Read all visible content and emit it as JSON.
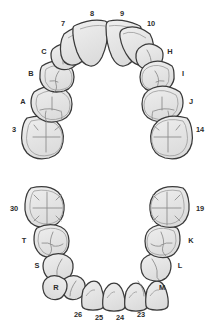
{
  "diagram": {
    "colors": {
      "background": "#ffffff",
      "tooth_fill": "#e6e6e6",
      "tooth_fill_light": "#ececec",
      "outline": "#3a3a3a",
      "inner_line": "#9a9a9a",
      "label_text": "#2b2b2b"
    },
    "arches": [
      {
        "name": "upper-arch",
        "label": "Maxillary arch",
        "teeth": [
          {
            "id": "upper-left-first-permanent-molar",
            "label": "3",
            "label_x": 14,
            "label_y": 130,
            "anchor": "mid",
            "type": "molar"
          },
          {
            "id": "upper-left-second-primary-molar",
            "label": "A",
            "label_x": 23,
            "label_y": 102,
            "anchor": "mid",
            "type": "primary-molar"
          },
          {
            "id": "upper-left-first-primary-molar",
            "label": "B",
            "label_x": 31,
            "label_y": 74,
            "anchor": "mid",
            "type": "primary-molar"
          },
          {
            "id": "upper-left-primary-canine",
            "label": "C",
            "label_x": 44,
            "label_y": 52,
            "anchor": "mid",
            "type": "canine"
          },
          {
            "id": "upper-left-lateral-incisor",
            "label": "7",
            "label_x": 63,
            "label_y": 24,
            "anchor": "mid",
            "type": "incisor"
          },
          {
            "id": "upper-left-central-incisor",
            "label": "8",
            "label_x": 92,
            "label_y": 14,
            "anchor": "mid",
            "type": "incisor"
          },
          {
            "id": "upper-right-central-incisor",
            "label": "9",
            "label_x": 122,
            "label_y": 14,
            "anchor": "mid",
            "type": "incisor"
          },
          {
            "id": "upper-right-lateral-incisor",
            "label": "10",
            "label_x": 151,
            "label_y": 24,
            "anchor": "mid",
            "type": "incisor"
          },
          {
            "id": "upper-right-primary-canine",
            "label": "H",
            "label_x": 170,
            "label_y": 52,
            "anchor": "mid",
            "type": "canine"
          },
          {
            "id": "upper-right-first-primary-molar",
            "label": "I",
            "label_x": 183,
            "label_y": 74,
            "anchor": "mid",
            "type": "primary-molar"
          },
          {
            "id": "upper-right-second-primary-molar",
            "label": "J",
            "label_x": 191,
            "label_y": 102,
            "anchor": "mid",
            "type": "primary-molar"
          },
          {
            "id": "upper-right-first-permanent-molar",
            "label": "14",
            "label_x": 200,
            "label_y": 130,
            "anchor": "mid",
            "type": "molar"
          }
        ]
      },
      {
        "name": "lower-arch",
        "label": "Mandibular arch",
        "teeth": [
          {
            "id": "lower-left-first-permanent-molar",
            "label": "30",
            "label_x": 14,
            "label_y": 209,
            "anchor": "mid",
            "type": "molar"
          },
          {
            "id": "lower-left-second-primary-molar",
            "label": "T",
            "label_x": 24,
            "label_y": 241,
            "anchor": "mid",
            "type": "primary-molar"
          },
          {
            "id": "lower-left-first-primary-molar",
            "label": "S",
            "label_x": 37,
            "label_y": 266,
            "anchor": "mid",
            "type": "primary-molar"
          },
          {
            "id": "lower-left-primary-canine",
            "label": "R",
            "label_x": 56,
            "label_y": 288,
            "anchor": "mid",
            "type": "canine"
          },
          {
            "id": "lower-left-lateral-incisor",
            "label": "26",
            "label_x": 78,
            "label_y": 315,
            "anchor": "mid",
            "type": "incisor"
          },
          {
            "id": "lower-left-central-incisor",
            "label": "25",
            "label_x": 99,
            "label_y": 318,
            "anchor": "mid",
            "type": "incisor"
          },
          {
            "id": "lower-right-central-incisor",
            "label": "24",
            "label_x": 120,
            "label_y": 318,
            "anchor": "mid",
            "type": "incisor"
          },
          {
            "id": "lower-right-lateral-incisor",
            "label": "23",
            "label_x": 141,
            "label_y": 315,
            "anchor": "mid",
            "type": "incisor"
          },
          {
            "id": "lower-right-primary-canine",
            "label": "M",
            "label_x": 162,
            "label_y": 288,
            "anchor": "mid",
            "type": "canine"
          },
          {
            "id": "lower-right-first-primary-molar",
            "label": "L",
            "label_x": 180,
            "label_y": 266,
            "anchor": "mid",
            "type": "primary-molar"
          },
          {
            "id": "lower-right-second-primary-molar",
            "label": "K",
            "label_x": 191,
            "label_y": 241,
            "anchor": "mid",
            "type": "primary-molar"
          },
          {
            "id": "lower-right-first-permanent-molar",
            "label": "19",
            "label_x": 200,
            "label_y": 209,
            "anchor": "mid",
            "type": "molar"
          }
        ]
      }
    ]
  }
}
